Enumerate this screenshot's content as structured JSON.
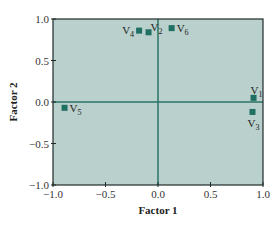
{
  "chart_data": {
    "type": "scatter",
    "title": "",
    "xlabel": "Factor 1",
    "ylabel": "Factor 2",
    "xlim": [
      -1.0,
      1.0
    ],
    "ylim": [
      -1.0,
      1.0
    ],
    "xticks": [
      "-1.0",
      "-0.5",
      "0.0",
      "0.5",
      "1.0"
    ],
    "yticks": [
      "1.0",
      "0.5",
      "0.0",
      "-0.5",
      "-1.0"
    ],
    "grid": false,
    "zero_lines": true,
    "legend": null,
    "points": [
      {
        "label": "V",
        "sub": "1",
        "x": 0.91,
        "y": 0.05,
        "label_pos": "above"
      },
      {
        "label": "V",
        "sub": "2",
        "x": -0.09,
        "y": 0.84,
        "label_pos": "right-up"
      },
      {
        "label": "V",
        "sub": "3",
        "x": 0.9,
        "y": -0.12,
        "label_pos": "below"
      },
      {
        "label": "V",
        "sub": "4",
        "x": -0.18,
        "y": 0.86,
        "label_pos": "left"
      },
      {
        "label": "V",
        "sub": "5",
        "x": -0.89,
        "y": -0.07,
        "label_pos": "right"
      },
      {
        "label": "V",
        "sub": "6",
        "x": 0.13,
        "y": 0.89,
        "label_pos": "right"
      }
    ]
  },
  "colors": {
    "plot_background": "#b9d0cc",
    "marker": "#1f6f63",
    "zero_line": "#2a7468",
    "frame": "#1e2a28"
  }
}
